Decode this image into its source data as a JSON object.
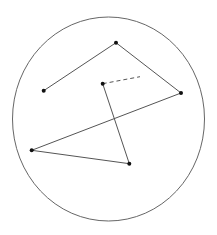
{
  "diagram": {
    "boundary": {
      "cx": 108.5,
      "cy": 119,
      "rx": 96,
      "ry": 102,
      "stroke": "#666666"
    },
    "points": [
      {
        "id": "p1",
        "x": 43.7,
        "y": 90.7
      },
      {
        "id": "p2",
        "x": 116,
        "y": 42.7
      },
      {
        "id": "p3",
        "x": 181,
        "y": 93
      },
      {
        "id": "p4",
        "x": 31.7,
        "y": 150.3
      },
      {
        "id": "p5",
        "x": 129.3,
        "y": 163.7
      },
      {
        "id": "p6",
        "x": 102.7,
        "y": 83.7
      }
    ],
    "path_solid": [
      "p1",
      "p2",
      "p3",
      "p4",
      "p5",
      "p6"
    ],
    "dashed_segment": {
      "from": {
        "x": 102.7,
        "y": 83.7
      },
      "to": {
        "x": 140,
        "y": 76.7
      }
    },
    "line_color": "#555555",
    "point_color": "#111111"
  }
}
